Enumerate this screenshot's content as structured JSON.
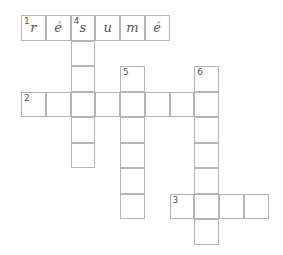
{
  "puzzle": {
    "grid": {
      "origin_x": 21,
      "origin_y": 15,
      "cell_w": 24.75,
      "cell_h": 25.5,
      "line_color": "#b5b5b5"
    },
    "entries": [
      {
        "number": "1",
        "direction": "across",
        "row": 0,
        "col": 0,
        "length": 6,
        "letters": [
          "r",
          "é",
          "s",
          "u",
          "m",
          "é"
        ]
      },
      {
        "number": "2",
        "direction": "across",
        "row": 3,
        "col": 0,
        "length": 8,
        "letters": [
          "",
          "",
          "",
          "",
          "",
          "",
          "",
          ""
        ]
      },
      {
        "number": "3",
        "direction": "across",
        "row": 7,
        "col": 6,
        "length": 4,
        "letters": [
          "",
          "",
          "",
          ""
        ]
      },
      {
        "number": "4",
        "direction": "down",
        "row": 0,
        "col": 2,
        "length": 6,
        "letters": [
          "s",
          "",
          "",
          "",
          "",
          ""
        ]
      },
      {
        "number": "5",
        "direction": "down",
        "row": 2,
        "col": 4,
        "length": 6,
        "letters": [
          "",
          "",
          "",
          "",
          "",
          ""
        ]
      },
      {
        "number": "6",
        "direction": "down",
        "row": 2,
        "col": 7,
        "length": 7,
        "letters": [
          "",
          "",
          "",
          "",
          "",
          "",
          ""
        ]
      }
    ]
  }
}
